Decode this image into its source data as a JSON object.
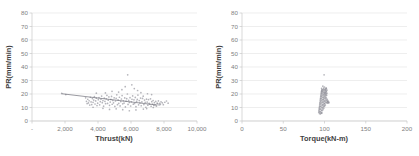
{
  "page": {
    "background": "#ffffff",
    "marker_color": "#8e8e96",
    "gridline_color": "#e2e2e2",
    "axis_color": "#c8c8c8",
    "tick_text_color": "#808080",
    "title_text_color": "#3f3f3f"
  },
  "chart_data": [
    {
      "id": "pr-vs-thrust",
      "type": "scatter",
      "title": "",
      "xlabel": "Thrust(kN)",
      "ylabel": "PR(mm/min)",
      "xlim": [
        0,
        10000
      ],
      "ylim": [
        0,
        80
      ],
      "grid": true,
      "legend": "none",
      "xticks": [
        0,
        2000,
        4000,
        6000,
        8000,
        10000
      ],
      "xticklabels": [
        "-",
        "2,000",
        "4,000",
        "6,000",
        "8,000",
        "10,000"
      ],
      "yticks": [
        0,
        10,
        20,
        30,
        40,
        50,
        60,
        70,
        80
      ],
      "yticklabels": [
        "0",
        "10",
        "20",
        "30",
        "40",
        "50",
        "60",
        "70",
        "80"
      ],
      "trendline": {
        "x": [
          1800,
          7600
        ],
        "y": [
          20.2,
          11.8
        ],
        "color": "#6f6f78"
      },
      "points": [
        [
          1800,
          20.4
        ],
        [
          2050,
          19.6
        ],
        [
          3250,
          17.2
        ],
        [
          3300,
          14.6
        ],
        [
          3340,
          12.9
        ],
        [
          3380,
          16.1
        ],
        [
          3420,
          13.4
        ],
        [
          3460,
          15.0
        ],
        [
          3500,
          11.8
        ],
        [
          3540,
          17.6
        ],
        [
          3580,
          14.1
        ],
        [
          3620,
          12.2
        ],
        [
          3660,
          16.6
        ],
        [
          3700,
          13.8
        ],
        [
          3740,
          15.5
        ],
        [
          3780,
          18.0
        ],
        [
          3820,
          12.6
        ],
        [
          3860,
          14.9
        ],
        [
          3900,
          16.9
        ],
        [
          3940,
          11.4
        ],
        [
          3980,
          13.2
        ],
        [
          4020,
          15.8
        ],
        [
          4060,
          17.4
        ],
        [
          4100,
          12.0
        ],
        [
          4140,
          14.3
        ],
        [
          4180,
          16.2
        ],
        [
          4220,
          18.5
        ],
        [
          4260,
          13.6
        ],
        [
          4300,
          15.1
        ],
        [
          4340,
          11.0
        ],
        [
          4380,
          17.0
        ],
        [
          4420,
          14.6
        ],
        [
          4460,
          12.8
        ],
        [
          4500,
          16.4
        ],
        [
          4540,
          19.0
        ],
        [
          4580,
          13.0
        ],
        [
          4620,
          15.4
        ],
        [
          4660,
          17.8
        ],
        [
          4700,
          11.6
        ],
        [
          4740,
          14.0
        ],
        [
          4780,
          16.0
        ],
        [
          4820,
          18.2
        ],
        [
          4860,
          12.4
        ],
        [
          4900,
          15.2
        ],
        [
          4940,
          13.5
        ],
        [
          4980,
          17.2
        ],
        [
          5020,
          10.8
        ],
        [
          5060,
          14.8
        ],
        [
          5100,
          16.8
        ],
        [
          5140,
          19.4
        ],
        [
          5180,
          12.1
        ],
        [
          5220,
          15.6
        ],
        [
          5260,
          13.1
        ],
        [
          5300,
          17.6
        ],
        [
          5340,
          11.2
        ],
        [
          5380,
          14.4
        ],
        [
          5420,
          16.3
        ],
        [
          5460,
          18.8
        ],
        [
          5500,
          12.7
        ],
        [
          5540,
          15.0
        ],
        [
          5580,
          13.3
        ],
        [
          5620,
          17.1
        ],
        [
          5660,
          10.4
        ],
        [
          5700,
          14.7
        ],
        [
          5740,
          16.5
        ],
        [
          5780,
          20.0
        ],
        [
          5820,
          12.3
        ],
        [
          5860,
          15.3
        ],
        [
          5900,
          13.7
        ],
        [
          5940,
          17.3
        ],
        [
          5980,
          11.1
        ],
        [
          6020,
          14.2
        ],
        [
          6060,
          16.1
        ],
        [
          6100,
          18.6
        ],
        [
          6140,
          12.5
        ],
        [
          6180,
          15.7
        ],
        [
          6220,
          13.0
        ],
        [
          6260,
          17.5
        ],
        [
          6300,
          10.6
        ],
        [
          6340,
          14.5
        ],
        [
          6380,
          16.0
        ],
        [
          6420,
          19.2
        ],
        [
          6460,
          12.0
        ],
        [
          6500,
          15.1
        ],
        [
          6540,
          13.4
        ],
        [
          6580,
          17.0
        ],
        [
          6620,
          11.3
        ],
        [
          6660,
          14.1
        ],
        [
          6700,
          16.7
        ],
        [
          6740,
          18.4
        ],
        [
          6780,
          12.2
        ],
        [
          6820,
          15.5
        ],
        [
          6860,
          13.8
        ],
        [
          6900,
          10.2
        ],
        [
          6940,
          16.2
        ],
        [
          6980,
          14.0
        ],
        [
          7020,
          11.7
        ],
        [
          7060,
          15.9
        ],
        [
          7100,
          13.1
        ],
        [
          7140,
          12.4
        ],
        [
          7180,
          16.4
        ],
        [
          7220,
          10.9
        ],
        [
          7260,
          14.3
        ],
        [
          7300,
          12.6
        ],
        [
          7340,
          15.2
        ],
        [
          7380,
          11.5
        ],
        [
          7420,
          13.6
        ],
        [
          7460,
          12.0
        ],
        [
          7500,
          14.6
        ],
        [
          7540,
          11.0
        ],
        [
          7580,
          13.2
        ],
        [
          7620,
          12.8
        ],
        [
          7660,
          14.9
        ],
        [
          7700,
          11.9
        ],
        [
          7740,
          13.0
        ],
        [
          7780,
          12.3
        ],
        [
          7820,
          14.2
        ],
        [
          7900,
          13.5
        ],
        [
          7960,
          12.1
        ],
        [
          8050,
          13.9
        ],
        [
          8150,
          14.8
        ],
        [
          8250,
          13.2
        ],
        [
          5800,
          34.2
        ],
        [
          6050,
          26.8
        ],
        [
          5650,
          25.4
        ],
        [
          6200,
          24.0
        ],
        [
          5450,
          23.2
        ],
        [
          6400,
          22.6
        ],
        [
          4850,
          22.0
        ],
        [
          5250,
          21.4
        ],
        [
          6600,
          21.0
        ],
        [
          4450,
          20.8
        ],
        [
          7000,
          20.2
        ],
        [
          3900,
          20.6
        ],
        [
          7250,
          19.6
        ],
        [
          6750,
          8.8
        ],
        [
          6300,
          8.2
        ],
        [
          5900,
          7.6
        ],
        [
          5500,
          8.4
        ],
        [
          5100,
          9.0
        ],
        [
          4700,
          8.6
        ],
        [
          4300,
          9.4
        ],
        [
          6950,
          9.2
        ],
        [
          7350,
          10.0
        ],
        [
          3700,
          10.2
        ]
      ]
    },
    {
      "id": "pr-vs-torque",
      "type": "scatter",
      "title": "",
      "xlabel": "Torque(kN-m)",
      "ylabel": "PR(mm/min)",
      "xlim": [
        0,
        200
      ],
      "ylim": [
        0,
        80
      ],
      "grid": true,
      "legend": "none",
      "xticks": [
        0,
        50,
        100,
        150,
        200
      ],
      "xticklabels": [
        "0",
        "50",
        "100",
        "150",
        "200"
      ],
      "yticks": [
        0,
        10,
        20,
        30,
        40,
        50,
        60,
        70,
        80
      ],
      "yticklabels": [
        "0",
        "10",
        "20",
        "30",
        "40",
        "50",
        "60",
        "70",
        "80"
      ],
      "trendline": null,
      "points": [
        [
          93.0,
          6.4
        ],
        [
          93.4,
          8.2
        ],
        [
          93.8,
          10.0
        ],
        [
          94.2,
          12.1
        ],
        [
          94.6,
          14.0
        ],
        [
          95.0,
          16.2
        ],
        [
          95.4,
          18.0
        ],
        [
          95.8,
          19.8
        ],
        [
          96.2,
          21.4
        ],
        [
          96.6,
          22.6
        ],
        [
          93.2,
          7.4
        ],
        [
          93.6,
          9.2
        ],
        [
          94.0,
          11.0
        ],
        [
          94.4,
          13.2
        ],
        [
          94.8,
          15.1
        ],
        [
          95.2,
          17.0
        ],
        [
          95.6,
          18.8
        ],
        [
          96.0,
          20.6
        ],
        [
          96.4,
          22.0
        ],
        [
          96.8,
          23.2
        ],
        [
          94.1,
          6.8
        ],
        [
          94.5,
          8.6
        ],
        [
          94.9,
          10.6
        ],
        [
          95.3,
          12.6
        ],
        [
          95.7,
          14.6
        ],
        [
          96.1,
          16.6
        ],
        [
          96.5,
          18.4
        ],
        [
          96.9,
          20.2
        ],
        [
          97.3,
          21.8
        ],
        [
          97.7,
          23.0
        ],
        [
          95.1,
          7.0
        ],
        [
          95.5,
          9.0
        ],
        [
          95.9,
          11.2
        ],
        [
          96.3,
          13.4
        ],
        [
          96.7,
          15.4
        ],
        [
          97.1,
          17.4
        ],
        [
          97.5,
          19.2
        ],
        [
          97.9,
          20.8
        ],
        [
          98.3,
          22.2
        ],
        [
          98.7,
          23.4
        ],
        [
          96.0,
          6.2
        ],
        [
          96.4,
          8.0
        ],
        [
          96.8,
          10.2
        ],
        [
          97.2,
          12.2
        ],
        [
          97.6,
          14.2
        ],
        [
          98.0,
          16.0
        ],
        [
          98.4,
          17.8
        ],
        [
          98.8,
          19.6
        ],
        [
          99.2,
          21.2
        ],
        [
          99.6,
          22.8
        ],
        [
          97.0,
          7.6
        ],
        [
          97.4,
          9.6
        ],
        [
          97.8,
          11.6
        ],
        [
          98.2,
          13.6
        ],
        [
          98.6,
          15.6
        ],
        [
          99.0,
          17.2
        ],
        [
          99.4,
          19.0
        ],
        [
          99.8,
          20.4
        ],
        [
          100.2,
          21.6
        ],
        [
          100.6,
          23.6
        ],
        [
          98.1,
          8.4
        ],
        [
          98.5,
          10.4
        ],
        [
          98.9,
          12.4
        ],
        [
          99.3,
          14.4
        ],
        [
          99.7,
          16.4
        ],
        [
          100.1,
          18.2
        ],
        [
          100.5,
          20.0
        ],
        [
          100.9,
          21.0
        ],
        [
          101.3,
          22.4
        ],
        [
          101.7,
          24.0
        ],
        [
          99.1,
          9.4
        ],
        [
          99.5,
          11.4
        ],
        [
          99.9,
          13.0
        ],
        [
          100.3,
          15.0
        ],
        [
          100.7,
          17.6
        ],
        [
          101.1,
          19.4
        ],
        [
          101.5,
          20.9
        ],
        [
          101.9,
          22.1
        ],
        [
          102.3,
          23.8
        ],
        [
          102.7,
          13.8
        ],
        [
          100.0,
          10.8
        ],
        [
          100.4,
          12.8
        ],
        [
          100.8,
          14.8
        ],
        [
          101.2,
          16.8
        ],
        [
          101.6,
          18.6
        ],
        [
          102.0,
          20.1
        ],
        [
          102.4,
          21.5
        ],
        [
          102.8,
          15.2
        ],
        [
          103.2,
          13.2
        ],
        [
          103.6,
          14.5
        ],
        [
          101.0,
          11.8
        ],
        [
          101.4,
          13.9
        ],
        [
          101.8,
          15.8
        ],
        [
          102.2,
          17.1
        ],
        [
          102.6,
          19.1
        ],
        [
          103.0,
          20.5
        ],
        [
          103.4,
          16.1
        ],
        [
          103.8,
          14.1
        ],
        [
          104.2,
          15.0
        ],
        [
          104.6,
          13.4
        ],
        [
          105.0,
          14.2
        ],
        [
          105.4,
          13.6
        ],
        [
          94.0,
          5.6
        ],
        [
          95.0,
          5.2
        ],
        [
          96.0,
          5.8
        ],
        [
          97.0,
          6.0
        ],
        [
          99.0,
          24.4
        ],
        [
          100.0,
          25.2
        ],
        [
          101.0,
          23.0
        ],
        [
          98.0,
          25.8
        ],
        [
          99.5,
          34.2
        ],
        [
          102.0,
          24.6
        ],
        [
          103.0,
          22.8
        ],
        [
          96.5,
          24.2
        ]
      ]
    }
  ],
  "bleed": {
    "fragment_left": "",
    "fragment_right": ""
  }
}
